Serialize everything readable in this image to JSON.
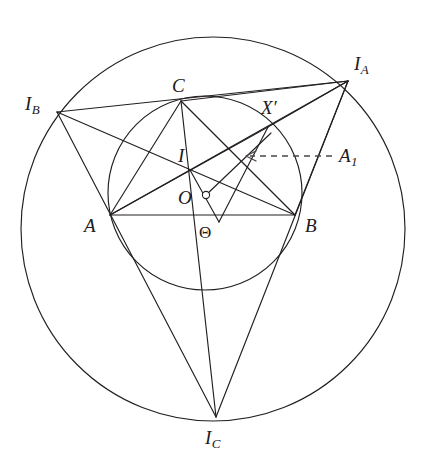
{
  "figure": {
    "type": "euclidean-geometry-diagram",
    "background_color": "#ffffff",
    "line_color": "#231f20",
    "dashed_line_color": "#4a4648"
  },
  "circles": [
    {
      "name": "circumcircle",
      "cx": 213,
      "cy": 229,
      "r": 192,
      "label": ""
    },
    {
      "name": "inner-circle",
      "cx": 205,
      "cy": 193,
      "r": 97,
      "label": ""
    }
  ],
  "points": [
    {
      "key": "A",
      "label": "A",
      "sub": "",
      "prime": false,
      "x": 110,
      "y": 215,
      "label_x": 84,
      "label_y": 215
    },
    {
      "key": "B",
      "label": "B",
      "sub": "",
      "prime": false,
      "x": 295,
      "y": 215,
      "label_x": 305,
      "label_y": 215
    },
    {
      "key": "C",
      "label": "C",
      "sub": "",
      "prime": false,
      "x": 181,
      "y": 101,
      "label_x": 172,
      "label_y": 78
    },
    {
      "key": "I",
      "label": "I",
      "sub": "",
      "prime": false,
      "x": 196,
      "y": 174,
      "label_x": 177,
      "label_y": 148
    },
    {
      "key": "O",
      "label": "O",
      "sub": "",
      "prime": false,
      "x": 205,
      "y": 195,
      "label_x": 179,
      "label_y": 192
    },
    {
      "key": "Theta",
      "label": "Θ",
      "sub": "",
      "prime": false,
      "x": 206,
      "y": 232,
      "label_x": 199,
      "label_y": 228
    },
    {
      "key": "Xp",
      "label": "X",
      "sub": "",
      "prime": true,
      "x": 268,
      "y": 127,
      "label_x": 262,
      "label_y": 100
    },
    {
      "key": "IA",
      "label": "I",
      "sub": "A",
      "prime": false,
      "x": 348,
      "y": 81,
      "label_x": 355,
      "label_y": 57
    },
    {
      "key": "IB",
      "label": "I",
      "sub": "B",
      "prime": false,
      "x": 57,
      "y": 112,
      "label_x": 25,
      "label_y": 97
    },
    {
      "key": "IC",
      "label": "I",
      "sub": "C",
      "prime": false,
      "x": 216,
      "y": 417,
      "label_x": 206,
      "label_y": 436
    },
    {
      "key": "A1",
      "label": "A",
      "sub": "1",
      "prime": false,
      "x": 330,
      "y": 156,
      "label_x": 339,
      "label_y": 149
    }
  ],
  "segments": [
    {
      "name": "side-AB",
      "from": "A",
      "to": "B"
    },
    {
      "name": "side-AC",
      "from": "A",
      "to": "C"
    },
    {
      "name": "side-BC-extended-to-IA",
      "from": "A",
      "to": "IA"
    },
    {
      "name": "excentral-IB-IA",
      "from": "IB",
      "to": "IA"
    },
    {
      "name": "excentral-IB-IC",
      "from": "IB",
      "to": "IC"
    },
    {
      "name": "excentral-IA-IC",
      "from": "IA",
      "to": "IC"
    },
    {
      "name": "cevian-A-IA",
      "from": "A",
      "to": "IA"
    },
    {
      "name": "cevian-B-IB",
      "from": "B",
      "to": "IB"
    },
    {
      "name": "cevian-C-IC",
      "from": "C",
      "to": "IC"
    },
    {
      "name": "chord-C-B",
      "from": "C",
      "to": "B"
    },
    {
      "name": "chord-C-IA",
      "from": "C",
      "to": "IA"
    },
    {
      "name": "chord-B-IA",
      "from": "B",
      "to": "IA"
    },
    {
      "name": "chord-Xp-IA",
      "from": "Xp",
      "to": "IA"
    },
    {
      "name": "chord-A-Xp",
      "from": "A",
      "to": "Xp"
    },
    {
      "name": "perp-foot-segment",
      "from": "I",
      "to": "Theta"
    }
  ],
  "annotations": {
    "dashed_arrow": {
      "name": "A1-pointer-arrow",
      "from_x": 332,
      "from_y": 156,
      "to_x": 246,
      "to_y": 156,
      "style": "dashed",
      "arrowhead": "left"
    },
    "right_angle_marker": {
      "name": "right-angle-at-O",
      "cx": 206,
      "cy": 195,
      "r": 4
    }
  }
}
